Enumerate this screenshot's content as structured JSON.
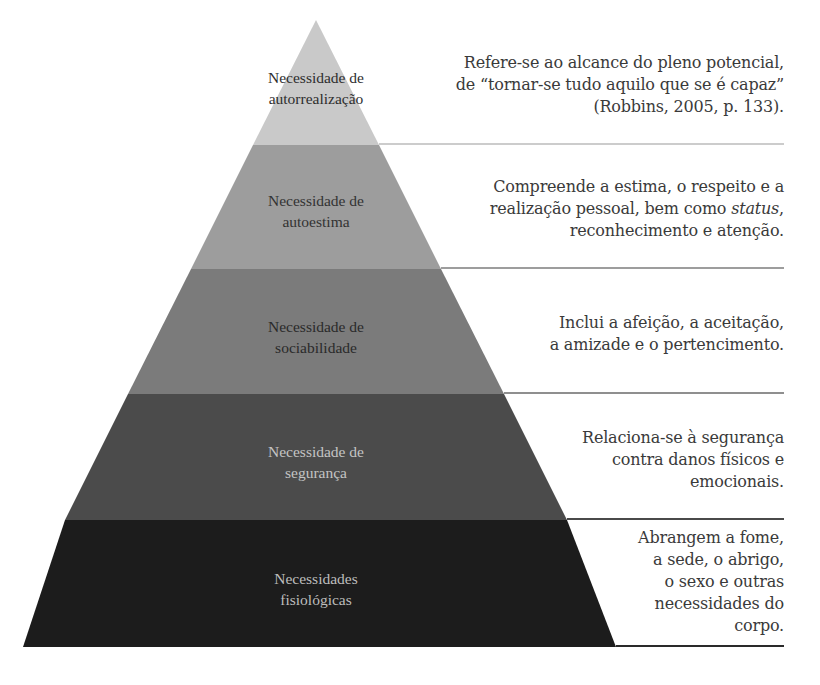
{
  "diagram": {
    "colors": {
      "layer1": "#c9c9c9",
      "layer2": "#9d9d9d",
      "layer3": "#7b7b7b",
      "layer4": "#4b4b4b",
      "layer5": "#1c1c1c",
      "divider": "#8a8a8a"
    },
    "layers": [
      {
        "label_line1": "Necessidade de",
        "label_line2": "autorrealização",
        "desc_lines": [
          "Refere-se ao alcance do pleno potencial,",
          "de “tornar-se tudo aquilo que se é capaz”",
          "(Robbins, 2005, p. 133)."
        ]
      },
      {
        "label_line1": "Necessidade de",
        "label_line2": "autoestima",
        "desc_lines": [
          "Compreende a estima, o respeito e a",
          "realização pessoal, bem como ",
          "status",
          ",",
          "reconhecimento e atenção."
        ]
      },
      {
        "label_line1": "Necessidade de",
        "label_line2": "sociabilidade",
        "desc_lines": [
          "Inclui a afeição, a aceitação,",
          "a amizade e o pertencimento."
        ]
      },
      {
        "label_line1": "Necessidade de",
        "label_line2": "segurança",
        "desc_lines": [
          "Relaciona-se à segurança",
          "contra danos físicos e",
          "emocionais."
        ]
      },
      {
        "label_line1": "Necessidades",
        "label_line2": "fisiológicas",
        "desc_lines": [
          "Abrangem a fome,",
          "a sede, o abrigo,",
          "o sexo e outras",
          "necessidades do",
          "corpo."
        ]
      }
    ]
  }
}
